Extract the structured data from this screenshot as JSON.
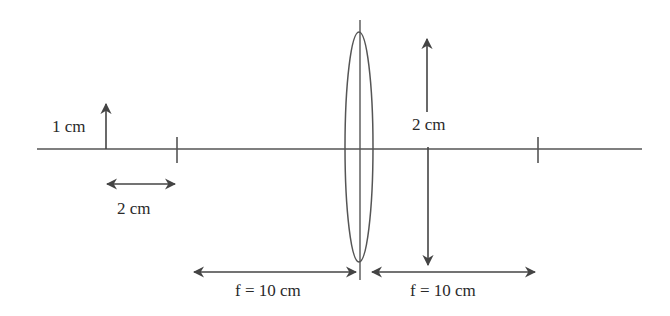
{
  "diagram": {
    "colors": {
      "line": "#555555",
      "text": "#2a2a2a",
      "background": "#ffffff"
    },
    "labels": {
      "object_height": "1 cm",
      "object_distance_marker": "2 cm",
      "image_height": "2 cm",
      "focal_left": "f = 10 cm",
      "focal_right": "f = 10 cm"
    },
    "elements": {
      "optical_axis": "principal axis",
      "lens": "convex lens",
      "object_arrow": "upright object arrow",
      "image_arrow": "double-headed image height arrow",
      "focal_points": [
        "left focal point tick",
        "right focal point tick"
      ]
    }
  }
}
